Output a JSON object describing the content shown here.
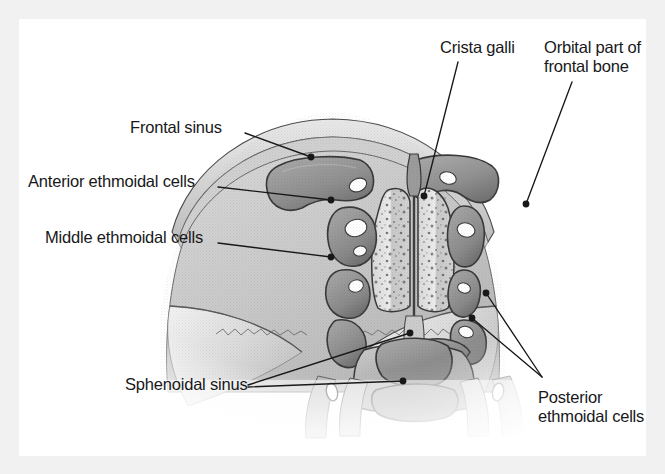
{
  "figure": {
    "background_color": "#f1f1f1",
    "panel_color": "#ffffff",
    "ink_color": "#18181a"
  },
  "labels": [
    {
      "id": "frontal-sinus",
      "text": "Frontal sinus",
      "x": 110,
      "y": 98,
      "align": "left",
      "multiline": false
    },
    {
      "id": "anterior-ethmoidal-cells",
      "text": "Anterior ethmoidal cells",
      "x": 8,
      "y": 152,
      "align": "left",
      "multiline": false
    },
    {
      "id": "middle-ethmoidal-cells",
      "text": "Middle ethmoidal cells",
      "x": 25,
      "y": 208,
      "align": "left",
      "multiline": false
    },
    {
      "id": "crista-galli",
      "text": "Crista galli",
      "x": 420,
      "y": 18,
      "align": "left",
      "multiline": false
    },
    {
      "id": "orbital-part-of-frontal-bone",
      "text": "Orbital part of\nfrontal bone",
      "x": 524,
      "y": 18,
      "align": "left",
      "multiline": true
    },
    {
      "id": "sphenoidal-sinus",
      "text": "Sphenoidal sinus",
      "x": 105,
      "y": 355,
      "align": "left",
      "multiline": false
    },
    {
      "id": "posterior-ethmoidal-cells",
      "text": "Posterior ethmoidal\ncells",
      "x": 518,
      "y": 368,
      "align": "left",
      "multiline": true
    }
  ],
  "leaders": [
    {
      "id": "leader-frontal-sinus",
      "for": "frontal-sinus",
      "path": "M 225 113 L 291 137",
      "dot": {
        "x": 291,
        "y": 137
      }
    },
    {
      "id": "leader-anterior-ethmoidal-cells",
      "for": "anterior-ethmoidal-cells",
      "path": "M 198 167 L 311 180",
      "dot": {
        "x": 311,
        "y": 180
      }
    },
    {
      "id": "leader-middle-ethmoidal-cells",
      "for": "middle-ethmoidal-cells",
      "path": "M 198 223 L 311 237",
      "dot": {
        "x": 311,
        "y": 237
      }
    },
    {
      "id": "leader-crista-galli",
      "for": "crista-galli",
      "path": "M 438 42 L 404 176",
      "dot": {
        "x": 404,
        "y": 176
      }
    },
    {
      "id": "leader-orbital-part-of-frontal-bone",
      "for": "orbital-part-of-frontal-bone",
      "path": "M 552 62 L 506 184",
      "dot": {
        "x": 506,
        "y": 184
      }
    },
    {
      "id": "leader-sphenoidal-sinus",
      "for": "sphenoidal-sinus",
      "path": "M 228 365 L 390 313",
      "dot": {
        "x": 390,
        "y": 313
      }
    },
    {
      "id": "leader-sphenoidal-sinus-lower",
      "for": "sphenoidal-sinus",
      "path": "M 228 367 L 383 361",
      "dot": {
        "x": 383,
        "y": 361
      }
    },
    {
      "id": "leader-posterior-ethmoidal-cells-upper",
      "for": "posterior-ethmoidal-cells",
      "path": "M 522 357 L 466 273",
      "dot": {
        "x": 466,
        "y": 273
      }
    },
    {
      "id": "leader-posterior-ethmoidal-cells-lower",
      "for": "posterior-ethmoidal-cells",
      "path": "M 522 357 L 452 298",
      "dot": {
        "x": 452,
        "y": 298
      }
    }
  ],
  "anatomy": {
    "structures": [
      "skull vault (outer table)",
      "diploe",
      "frontal sinus (paired)",
      "anterior ethmoidal air cells",
      "middle ethmoidal air cells",
      "posterior ethmoidal air cells",
      "crista galli",
      "perpendicular plate of ethmoid",
      "nasal septum",
      "orbital part of frontal bone",
      "orbital roof",
      "sphenoidal sinus",
      "sphenoid body"
    ],
    "palette": {
      "bone_light": "#dedede",
      "bone_mid": "#c2c2c2",
      "cavity_mid": "#9a9a9a",
      "cavity_dark": "#6f6f6f",
      "outline": "#2b2b2b",
      "highlight": "#ffffff"
    }
  }
}
